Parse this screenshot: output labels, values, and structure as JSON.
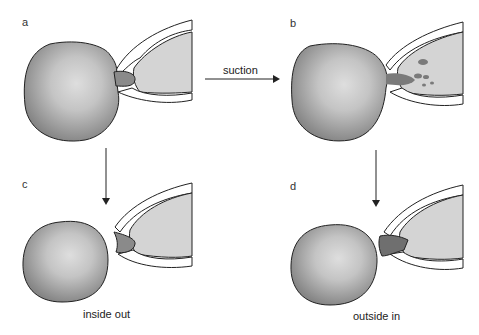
{
  "panels": {
    "a": {
      "label": "a"
    },
    "b": {
      "label": "b"
    },
    "c": {
      "label": "c",
      "caption": "inside out"
    },
    "d": {
      "label": "d",
      "caption": "outside in"
    }
  },
  "arrows": {
    "horizontal_label": "suction"
  },
  "colors": {
    "cell_fill": "#8a8a8a",
    "cell_center": "#d8d8d8",
    "pipette_fill": "#d4d4d4",
    "outline": "#222222"
  }
}
